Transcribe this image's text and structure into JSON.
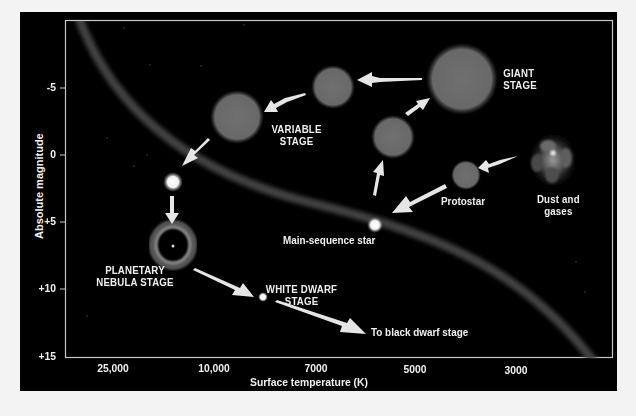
{
  "axes": {
    "y_label": "Absolute magnitude",
    "y_ticks": [
      "-5",
      "0",
      "+5",
      "+10",
      "+15"
    ],
    "x_label": "Surface temperature (K)",
    "x_ticks": [
      "25,000",
      "10,000",
      "7000",
      "5000",
      "3000"
    ]
  },
  "stages": {
    "dust": {
      "line1": "Dust and",
      "line2": "gases"
    },
    "protostar": "Protostar",
    "main_sequence": "Main-sequence star",
    "giant": {
      "line1": "GIANT",
      "line2": "STAGE"
    },
    "variable": {
      "line1": "VARIABLE",
      "line2": "STAGE"
    },
    "planetary_nebula": {
      "line1": "PLANETARY",
      "line2": "NEBULA STAGE"
    },
    "white_dwarf": {
      "line1": "WHITE DWARF",
      "line2": "STAGE"
    },
    "black_dwarf": "To black dwarf stage"
  },
  "colors": {
    "background": "#000000",
    "page": "#f3f3f3",
    "border": "#c8c8c8",
    "sphere": "#6e6e6e",
    "arrow": "#e6e6e6",
    "text": "#f0f0f0",
    "main_sequence_band": "#3a3a3a"
  }
}
